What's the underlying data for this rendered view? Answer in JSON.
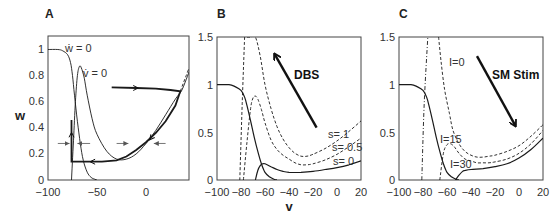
{
  "chart_data": [
    {
      "panel": "A",
      "type": "line",
      "title": "",
      "xlabel": "",
      "ylabel": "w",
      "xlim": [
        -100,
        44
      ],
      "ylim": [
        0,
        1.1
      ],
      "xticks": [
        -100,
        -50,
        0
      ],
      "yticks": [
        0,
        0.2,
        0.4,
        0.6,
        0.8,
        1
      ],
      "grid": false,
      "annotations": [
        "ẇ = 0",
        "v̇ = 0"
      ],
      "series": [
        {
          "name": "w-nullcline (ẇ=0)",
          "style": "solid-thin",
          "x": [
            -100,
            -90,
            -85,
            -80,
            -77,
            -75,
            -73,
            -70,
            -67,
            -64,
            -60,
            -56,
            -52,
            -50
          ],
          "y": [
            1.0,
            1.0,
            0.99,
            0.96,
            0.9,
            0.8,
            0.65,
            0.45,
            0.28,
            0.15,
            0.06,
            0.02,
            0.005,
            0.0
          ]
        },
        {
          "name": "v-nullcline (v̇=0)",
          "style": "solid-thin",
          "x": [
            -76,
            -74,
            -72,
            -70,
            -68,
            -66,
            -63,
            -60,
            -55,
            -50,
            -40,
            -30,
            -20,
            -10,
            0,
            10,
            20,
            30,
            36,
            40,
            44
          ],
          "y": [
            0.0,
            0.3,
            0.6,
            0.8,
            0.87,
            0.86,
            0.78,
            0.65,
            0.47,
            0.35,
            0.22,
            0.16,
            0.16,
            0.2,
            0.28,
            0.38,
            0.5,
            0.62,
            0.68,
            0.75,
            0.83
          ]
        },
        {
          "name": "trajectory",
          "style": "solid-thick",
          "x": [
            -35,
            -10,
            10,
            25,
            35,
            30,
            20,
            10,
            0,
            -10,
            -20,
            -30,
            -45,
            -60,
            -76,
            -76
          ],
          "y": [
            0.71,
            0.705,
            0.7,
            0.69,
            0.68,
            0.57,
            0.45,
            0.36,
            0.29,
            0.23,
            0.18,
            0.15,
            0.14,
            0.14,
            0.14,
            0.46
          ]
        },
        {
          "name": "extension",
          "style": "dashed",
          "x": [
            35,
            38,
            41,
            44
          ],
          "y": [
            0.68,
            0.74,
            0.8,
            0.86
          ]
        }
      ],
      "arrows": [
        {
          "x1": -90,
          "y1": 0.28,
          "x2": -78,
          "y2": 0.28
        },
        {
          "x1": -57,
          "y1": 0.28,
          "x2": -70,
          "y2": 0.28
        },
        {
          "x1": -30,
          "y1": 0.28,
          "x2": -18,
          "y2": 0.28
        },
        {
          "x1": 20,
          "y1": 0.28,
          "x2": 8,
          "y2": 0.28
        }
      ]
    },
    {
      "panel": "B",
      "type": "line",
      "title": "",
      "xlabel": "v",
      "ylabel": "",
      "xlim": [
        -100,
        20
      ],
      "ylim": [
        0,
        1.5
      ],
      "xticks": [
        -100,
        -80,
        -60,
        -40,
        -20,
        0,
        20
      ],
      "yticks": [
        0,
        0.5,
        1,
        1.5
      ],
      "grid": false,
      "annotations": [
        "DBS",
        "s= 1",
        "s= 0.5",
        "s= 0"
      ],
      "series": [
        {
          "name": "w-nullcline",
          "style": "solid",
          "x": [
            -100,
            -90,
            -85,
            -80,
            -77,
            -75,
            -72,
            -69,
            -66,
            -63,
            -60,
            -56,
            -52,
            -50
          ],
          "y": [
            1.0,
            1.0,
            0.98,
            0.94,
            0.87,
            0.78,
            0.62,
            0.45,
            0.3,
            0.17,
            0.08,
            0.03,
            0.005,
            0.0
          ]
        },
        {
          "name": "s=0",
          "style": "solid",
          "x": [
            -68,
            -66,
            -64,
            -62,
            -60,
            -55,
            -50,
            -45,
            -40,
            -30,
            -20,
            -10,
            0,
            10,
            20
          ],
          "y": [
            0.0,
            0.1,
            0.15,
            0.17,
            0.17,
            0.14,
            0.11,
            0.09,
            0.08,
            0.08,
            0.09,
            0.11,
            0.13,
            0.16,
            0.2
          ]
        },
        {
          "name": "s=0.5",
          "style": "dashed",
          "x": [
            -78,
            -75,
            -72,
            -70,
            -68,
            -66,
            -63,
            -60,
            -55,
            -50,
            -45,
            -40,
            -35,
            -30,
            -25,
            -20,
            -10,
            0,
            10,
            20
          ],
          "y": [
            0.0,
            0.4,
            0.75,
            0.86,
            0.88,
            0.85,
            0.74,
            0.6,
            0.42,
            0.32,
            0.26,
            0.22,
            0.18,
            0.16,
            0.16,
            0.17,
            0.21,
            0.27,
            0.35,
            0.44
          ]
        },
        {
          "name": "s=1",
          "style": "dashed",
          "x": [
            -75,
            -72,
            -68,
            -64,
            -60,
            -55,
            -50,
            -45,
            -40,
            -35,
            -30,
            -25,
            -20,
            -10,
            0,
            10,
            20
          ],
          "y": [
            1.5,
            1.5,
            1.5,
            1.3,
            1.0,
            0.75,
            0.56,
            0.43,
            0.34,
            0.28,
            0.25,
            0.25,
            0.27,
            0.33,
            0.41,
            0.51,
            0.62
          ]
        },
        {
          "name": "s=1 left branch",
          "style": "dashed",
          "x": [
            -81,
            -79,
            -77
          ],
          "y": [
            0.0,
            0.8,
            1.5
          ]
        }
      ],
      "arrow": {
        "label": "DBS",
        "direction": "up-left",
        "x1": -17,
        "y1": 0.55,
        "x2": -52,
        "y2": 1.32
      }
    },
    {
      "panel": "C",
      "type": "line",
      "title": "",
      "xlabel": "",
      "ylabel": "",
      "xlim": [
        -100,
        20
      ],
      "ylim": [
        0,
        1.5
      ],
      "xticks": [
        -100,
        -80,
        -60,
        -40,
        -20,
        0,
        20
      ],
      "yticks": [
        0,
        0.5,
        1,
        1.5
      ],
      "grid": false,
      "annotations": [
        "SM Stim",
        "I=0",
        "I=15",
        "I=30"
      ],
      "series": [
        {
          "name": "w-nullcline",
          "style": "solid",
          "x": [
            -100,
            -90,
            -85,
            -80,
            -77,
            -75,
            -72,
            -69,
            -66,
            -63,
            -60,
            -56,
            -52,
            -50
          ],
          "y": [
            1.0,
            1.0,
            0.98,
            0.94,
            0.87,
            0.78,
            0.62,
            0.45,
            0.3,
            0.17,
            0.08,
            0.03,
            0.005,
            0.0
          ]
        },
        {
          "name": "I=30",
          "style": "solid",
          "x": [
            -53,
            -50,
            -47,
            -45,
            -40,
            -30,
            -20,
            -10,
            0,
            10,
            20
          ],
          "y": [
            0.0,
            0.05,
            0.09,
            0.1,
            0.11,
            0.12,
            0.14,
            0.17,
            0.23,
            0.32,
            0.44
          ]
        },
        {
          "name": "I=15",
          "style": "dashed",
          "x": [
            -66,
            -63,
            -60,
            -57,
            -54,
            -50,
            -45,
            -40,
            -35,
            -30,
            -25,
            -20,
            -10,
            0,
            10,
            20
          ],
          "y": [
            0.0,
            0.28,
            0.37,
            0.38,
            0.35,
            0.28,
            0.22,
            0.2,
            0.18,
            0.18,
            0.18,
            0.19,
            0.22,
            0.28,
            0.38,
            0.52
          ]
        },
        {
          "name": "I=0",
          "style": "dashed",
          "x": [
            -67,
            -65,
            -62,
            -58,
            -55,
            -50,
            -45,
            -40,
            -35,
            -30,
            -25,
            -20,
            -10,
            0,
            10,
            20
          ],
          "y": [
            1.5,
            1.25,
            0.95,
            0.7,
            0.52,
            0.38,
            0.3,
            0.26,
            0.24,
            0.24,
            0.25,
            0.26,
            0.3,
            0.36,
            0.46,
            0.58
          ]
        },
        {
          "name": "left branch",
          "style": "dashdot",
          "x": [
            -81,
            -79,
            -76
          ],
          "y": [
            0.0,
            0.8,
            1.5
          ]
        }
      ],
      "arrow": {
        "label": "SM Stim",
        "direction": "down-right",
        "x1": -35,
        "y1": 1.3,
        "x2": -3,
        "y2": 0.57
      }
    }
  ],
  "panels": {
    "A": {
      "letter": "A",
      "ylabel": "w",
      "ann_wdot": "ẇ = 0",
      "ann_vdot": "v̇ = 0",
      "yticks": [
        "1",
        "0.8",
        "0.6",
        "0.4",
        "0.2",
        "0"
      ],
      "xticks": [
        "−100",
        "−50",
        "0"
      ]
    },
    "B": {
      "letter": "B",
      "xlabel": "v",
      "arrow_label": "DBS",
      "s1": "s= 1",
      "s05": "s= 0.5",
      "s0": "s= 0",
      "yticks": [
        "1.5",
        "1",
        "0.5",
        "0"
      ],
      "xticks": [
        "−100",
        "−80",
        "−60",
        "−40",
        "−20",
        "0",
        "20"
      ]
    },
    "C": {
      "letter": "C",
      "arrow_label": "SM Stim",
      "i0": "I=0",
      "i15": "I=15",
      "i30": "I=30",
      "yticks": [
        "1.5",
        "1",
        "0.5",
        "0"
      ],
      "xticks": [
        "−100",
        "−80",
        "−60",
        "−40",
        "−20",
        "0",
        "20"
      ]
    }
  },
  "colors": {
    "line": "#1a1a1a",
    "thin": "#333333",
    "axis": "#444444",
    "arrow_gray": "#777777"
  }
}
